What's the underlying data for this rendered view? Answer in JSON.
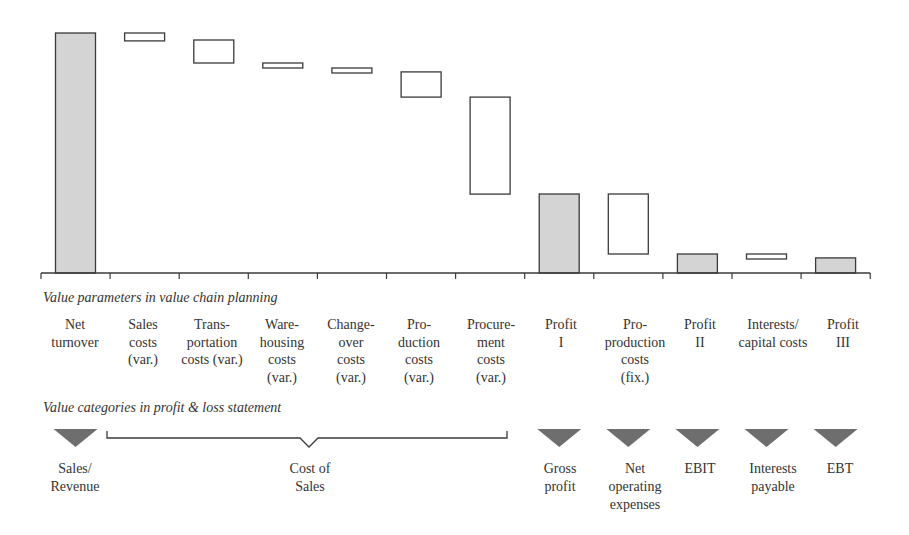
{
  "chart_data": {
    "type": "bar",
    "subtype": "waterfall",
    "title": "",
    "xlabel": "",
    "ylabel": "",
    "grid": false,
    "legend": null,
    "categories": [
      "Net turnover",
      "Sales costs (var.)",
      "Transportation costs (var.)",
      "Warehousing costs (var.)",
      "Changeover costs (var.)",
      "Production costs (var.)",
      "Procurement costs (var.)",
      "Profit I",
      "Pro-production costs (fix.)",
      "Profit II",
      "Interests/ capital costs",
      "Profit III"
    ],
    "series": [
      {
        "name": "Waterfall (relative units, Net turnover = 100)",
        "bars": [
          {
            "label": "Net turnover",
            "kind": "total",
            "start": 0,
            "end": 100
          },
          {
            "label": "Sales costs (var.)",
            "kind": "cost",
            "start": 100,
            "end": 96.7
          },
          {
            "label": "Transportation costs (var.)",
            "kind": "cost",
            "start": 97.1,
            "end": 87.5
          },
          {
            "label": "Warehousing costs (var.)",
            "kind": "cost",
            "start": 87.5,
            "end": 85.4
          },
          {
            "label": "Changeover costs (var.)",
            "kind": "cost",
            "start": 85.4,
            "end": 83.3
          },
          {
            "label": "Production costs (var.)",
            "kind": "cost",
            "start": 83.8,
            "end": 73.3
          },
          {
            "label": "Procurement costs (var.)",
            "kind": "cost",
            "start": 73.3,
            "end": 32.9
          },
          {
            "label": "Profit I",
            "kind": "total",
            "start": 0,
            "end": 32.9
          },
          {
            "label": "Pro-production costs (fix.)",
            "kind": "cost",
            "start": 32.9,
            "end": 7.9
          },
          {
            "label": "Profit II",
            "kind": "total",
            "start": 0,
            "end": 7.9
          },
          {
            "label": "Interests/ capital costs",
            "kind": "cost",
            "start": 7.9,
            "end": 5.8
          },
          {
            "label": "Profit III",
            "kind": "total",
            "start": 0,
            "end": 6.3
          }
        ]
      }
    ],
    "annotations": [
      "Value parameters in value chain planning",
      "Value categories in profit & loss statement"
    ]
  },
  "colors": {
    "total_fill": "#d4d4d4",
    "cost_fill": "#ffffff",
    "stroke": "#3a3a3a",
    "marker": "#6e6e6e"
  },
  "sections": {
    "parameters_title": "Value parameters in value chain planning",
    "categories_title": "Value categories in profit & loss statement"
  },
  "parameter_labels": [
    "Net\nturnover",
    "Sales\ncosts\n(var.)",
    "Trans-\nportation\ncosts (var.)",
    "Ware-\nhousing\ncosts\n(var.)",
    "Change-\nover\ncosts\n(var.)",
    "Pro-\nduction\ncosts\n(var.)",
    "Procure-\nment\ncosts\n(var.)",
    "Profit\nI",
    "Pro-\nproduction\ncosts\n(fix.)",
    "Profit\nII",
    "Interests/\ncapital costs",
    "Profit\nIII"
  ],
  "category_labels": {
    "sales_revenue": "Sales/\nRevenue",
    "cost_of_sales": "Cost of\nSales",
    "gross_profit": "Gross\nprofit",
    "net_operating_expenses": "Net\noperating\nexpenses",
    "ebit": "EBIT",
    "interests_payable": "Interests\npayable",
    "ebt": "EBT"
  }
}
